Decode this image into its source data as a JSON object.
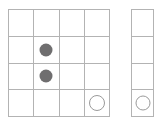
{
  "scene": {
    "title": "Grid board with pieces",
    "background_color": "#ffffff",
    "grid_line_color": "#b3b3b3",
    "filled_piece_color": "#6f6e6f",
    "open_piece_color": "#9a9a9a"
  },
  "boards": [
    {
      "name": "main-board",
      "columns": 4,
      "rows": 4,
      "cells": [
        {
          "row": 1,
          "col": 1,
          "piece": ""
        },
        {
          "row": 1,
          "col": 2,
          "piece": ""
        },
        {
          "row": 1,
          "col": 3,
          "piece": ""
        },
        {
          "row": 1,
          "col": 4,
          "piece": ""
        },
        {
          "row": 2,
          "col": 1,
          "piece": ""
        },
        {
          "row": 2,
          "col": 2,
          "piece": "filled"
        },
        {
          "row": 2,
          "col": 3,
          "piece": ""
        },
        {
          "row": 2,
          "col": 4,
          "piece": ""
        },
        {
          "row": 3,
          "col": 1,
          "piece": ""
        },
        {
          "row": 3,
          "col": 2,
          "piece": "filled"
        },
        {
          "row": 3,
          "col": 3,
          "piece": ""
        },
        {
          "row": 3,
          "col": 4,
          "piece": ""
        },
        {
          "row": 4,
          "col": 1,
          "piece": ""
        },
        {
          "row": 4,
          "col": 2,
          "piece": ""
        },
        {
          "row": 4,
          "col": 3,
          "piece": ""
        },
        {
          "row": 4,
          "col": 4,
          "piece": "open"
        }
      ]
    },
    {
      "name": "side-board",
      "columns": 1,
      "rows": 4,
      "cells": [
        {
          "row": 1,
          "col": 1,
          "piece": ""
        },
        {
          "row": 2,
          "col": 1,
          "piece": ""
        },
        {
          "row": 3,
          "col": 1,
          "piece": ""
        },
        {
          "row": 4,
          "col": 1,
          "piece": "open"
        }
      ]
    }
  ]
}
